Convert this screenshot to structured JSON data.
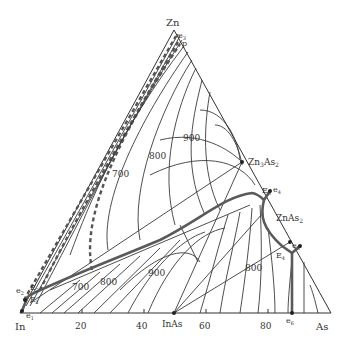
{
  "diagram": {
    "type": "ternary-phase-diagram",
    "vertices": {
      "top": "Zn",
      "left": "In",
      "right": "As"
    },
    "bottom_axis_ticks": [
      "20",
      "40",
      "60",
      "80"
    ],
    "compounds": {
      "inas": "InAs",
      "zn3as2": {
        "base": "Zn",
        "sub1": "3",
        "mid": "As",
        "sub2": "2"
      },
      "znas2": {
        "base": "ZnAs",
        "sub": "2"
      }
    },
    "points": {
      "e1": {
        "base": "e",
        "sub": "1"
      },
      "e2": {
        "base": "e",
        "sub": "2"
      },
      "e3": {
        "base": "e",
        "sub": "3"
      },
      "e4": {
        "base": "e",
        "sub": "4"
      },
      "e5": {
        "base": "e",
        "sub": "5"
      },
      "e6": {
        "base": "e",
        "sub": "6"
      },
      "E1": {
        "base": "E",
        "sub": "1"
      },
      "E2": {
        "base": "E",
        "sub": "2"
      },
      "E3": {
        "base": "E",
        "sub": "3"
      },
      "E4": {
        "base": "E",
        "sub": "4"
      },
      "p": "p"
    },
    "isotherm_labels": [
      {
        "id": "iso-900-top",
        "text": "900"
      },
      {
        "id": "iso-800-top",
        "text": "800"
      },
      {
        "id": "iso-700-top",
        "text": "700"
      },
      {
        "id": "iso-700-bottom",
        "text": "700"
      },
      {
        "id": "iso-800-bottom",
        "text": "800"
      },
      {
        "id": "iso-900-bottom",
        "text": "900"
      },
      {
        "id": "iso-800-right",
        "text": "800"
      }
    ],
    "colors": {
      "lines": "#3a3a3a",
      "eutectic_valleys": "#5a5a5a",
      "background": "#ffffff"
    }
  }
}
